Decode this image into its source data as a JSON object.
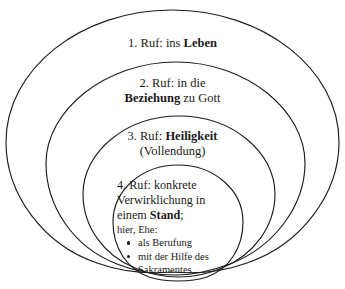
{
  "figure": {
    "type": "nested-ellipse-diagram",
    "background_color": "#ffffff",
    "stroke_color": "#1d1d1d",
    "text_color": "#1a1a1a",
    "ring_count": 4
  },
  "rings": [
    {
      "index": "1",
      "lines": [
        {
          "prefix": "1. Ruf: ins ",
          "emphasis": "Leben",
          "suffix": ""
        }
      ]
    },
    {
      "index": "2",
      "lines": [
        {
          "prefix": "2. Ruf: in die",
          "emphasis": "",
          "suffix": ""
        },
        {
          "prefix": "",
          "emphasis": "Beziehung",
          "suffix": " zu Gott"
        }
      ]
    },
    {
      "index": "3",
      "lines": [
        {
          "prefix": "3. Ruf: ",
          "emphasis": "Heiligkeit",
          "suffix": ""
        },
        {
          "prefix": "(Vollendung)",
          "emphasis": "",
          "suffix": ""
        }
      ]
    },
    {
      "index": "4",
      "lines": [
        {
          "prefix": "4. Ruf: konkrete",
          "emphasis": "",
          "suffix": ""
        },
        {
          "prefix": "Verwirklichung in",
          "emphasis": "",
          "suffix": ""
        },
        {
          "prefix": "einem ",
          "emphasis": "Stand",
          "suffix": ";"
        }
      ],
      "sub_line": "hier, Ehe:",
      "bullets": [
        {
          "line1": "als Berufung",
          "line2": ""
        },
        {
          "line1": "mit der Hilfe des",
          "line2": "Sakramentes"
        }
      ]
    }
  ],
  "ring_labels": {
    "ring1_l1_prefix": "1. Ruf: ins ",
    "ring1_l1_bold": "Leben",
    "ring2_l1": "2. Ruf: in die",
    "ring2_l2_bold": "Beziehung",
    "ring2_l2_suffix": " zu Gott",
    "ring3_l1_prefix": "3. Ruf: ",
    "ring3_l1_bold": "Heiligkeit",
    "ring3_l2": "(Vollendung)",
    "ring4_l1": "4. Ruf: konkrete",
    "ring4_l2": "Verwirklichung in",
    "ring4_l3_prefix": "einem ",
    "ring4_l3_bold": "Stand",
    "ring4_l3_suffix": ";",
    "ring4_sub": "hier, Ehe:",
    "ring4_bullet1": "als Berufung",
    "ring4_bullet2_line1": "mit der Hilfe des",
    "ring4_bullet2_line2": "Sakramentes"
  }
}
